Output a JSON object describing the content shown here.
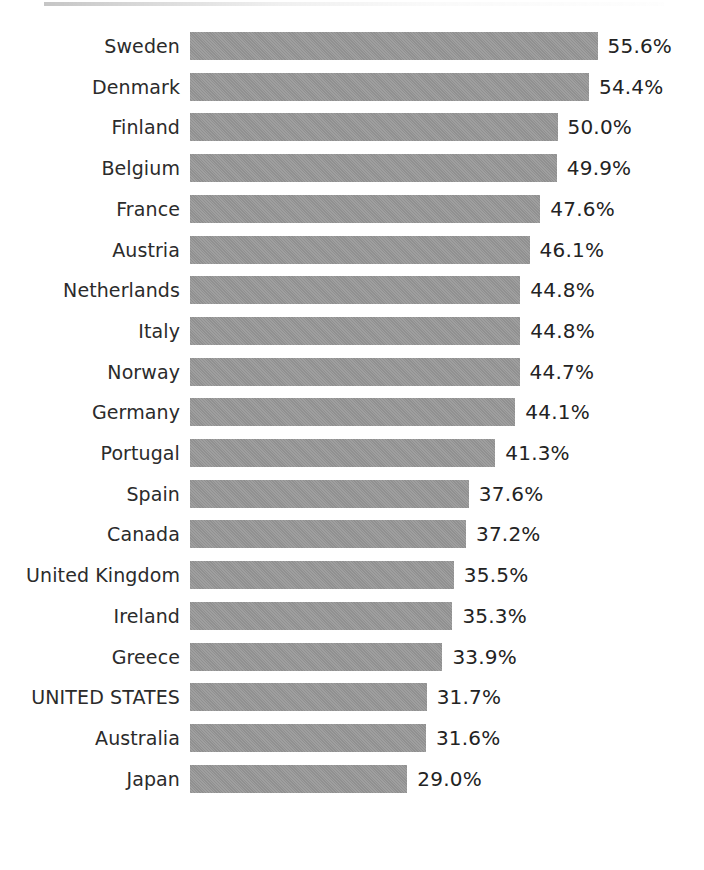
{
  "chart_data": {
    "type": "bar",
    "orientation": "horizontal",
    "title": "",
    "subtitle": "",
    "xlabel": "",
    "ylabel": "",
    "grid": false,
    "legend": null,
    "axis_visible": false,
    "tick_labels": [],
    "value_suffix": "%",
    "xlim": [
      0,
      55.6
    ],
    "bar_color": "#989898",
    "label_color": "#2b2b2b",
    "value_color": "#232323",
    "background_color": "#ffffff",
    "highlighted_category": "UNITED STATES",
    "categories": [
      "Sweden",
      "Denmark",
      "Finland",
      "Belgium",
      "France",
      "Austria",
      "Netherlands",
      "Italy",
      "Norway",
      "Germany",
      "Portugal",
      "Spain",
      "Canada",
      "United Kingdom",
      "Ireland",
      "Greece",
      "UNITED STATES",
      "Australia",
      "Japan"
    ],
    "values": [
      55.6,
      54.4,
      50.0,
      49.9,
      47.6,
      46.1,
      44.8,
      44.8,
      44.7,
      44.1,
      41.3,
      37.6,
      37.2,
      35.5,
      35.3,
      33.9,
      31.7,
      31.6,
      29.0
    ],
    "value_labels": [
      "55.6%",
      "54.4%",
      "50.0%",
      "49.9%",
      "47.6%",
      "46.1%",
      "44.8%",
      "44.8%",
      "44.7%",
      "44.1%",
      "41.3%",
      "37.6%",
      "37.2%",
      "35.5%",
      "35.3%",
      "33.9%",
      "31.7%",
      "31.6%",
      "29.0%"
    ]
  },
  "layout": {
    "bar_left_px": 190,
    "bar_height_px": 28,
    "row_pitch_px": 40.7,
    "first_row_top_px": 32,
    "px_per_unit": 7.15,
    "baseline_offset_px": 10,
    "value_gap_px": 10
  }
}
